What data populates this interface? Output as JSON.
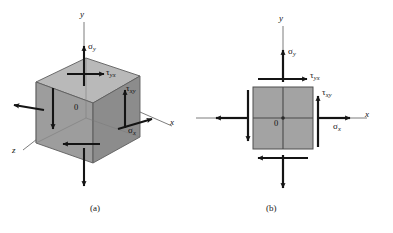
{
  "figure": {
    "background": "#ffffff",
    "width": 393,
    "height": 233,
    "colors": {
      "face_front": "#9a9a9a",
      "face_top": "#b4b4b4",
      "face_side": "#8a8a8a",
      "square_fill": "#a0a0a0",
      "stroke": "#1a1a1a",
      "axis_thin": "#6e6e6e"
    }
  },
  "panels": [
    {
      "id": "a",
      "caption": "(a)",
      "type": "3d-stress-element",
      "description": "Three-dimensional cubic stress element with normal and shear stresses",
      "axes": [
        {
          "name": "y-axis",
          "label": "y"
        },
        {
          "name": "x-axis",
          "label": "x"
        },
        {
          "name": "z-axis",
          "label": "z"
        }
      ],
      "origin_label": "0",
      "stress_labels": [
        {
          "name": "sigma-y",
          "symbol": "σ",
          "subscript": "y"
        },
        {
          "name": "sigma-x",
          "symbol": "σ",
          "subscript": "x"
        },
        {
          "name": "tau-yx",
          "symbol": "τ",
          "subscript": "yx"
        },
        {
          "name": "tau-xy",
          "symbol": "τ",
          "subscript": "xy"
        }
      ]
    },
    {
      "id": "b",
      "caption": "(b)",
      "type": "2d-stress-element",
      "description": "Two-dimensional plane stress element with normal and shear stresses",
      "axes": [
        {
          "name": "y-axis",
          "label": "y"
        },
        {
          "name": "x-axis",
          "label": "x"
        }
      ],
      "origin_label": "0",
      "stress_labels": [
        {
          "name": "sigma-y",
          "symbol": "σ",
          "subscript": "y"
        },
        {
          "name": "sigma-x",
          "symbol": "σ",
          "subscript": "x"
        },
        {
          "name": "tau-yx",
          "symbol": "τ",
          "subscript": "yx"
        },
        {
          "name": "tau-xy",
          "symbol": "τ",
          "subscript": "xy"
        }
      ]
    }
  ],
  "labels": {
    "a_axis_y": "y",
    "a_axis_x": "x",
    "a_axis_z": "z",
    "a_origin": "0",
    "a_sigma_y": "σ",
    "a_sigma_y_sub": "y",
    "a_sigma_x": "σ",
    "a_sigma_x_sub": "x",
    "a_tau_yx": "τ",
    "a_tau_yx_sub": "yx",
    "a_tau_xy": "τ",
    "a_tau_xy_sub": "xy",
    "b_axis_y": "y",
    "b_axis_x": "x",
    "b_origin": "0",
    "b_sigma_y": "σ",
    "b_sigma_y_sub": "y",
    "b_sigma_x": "σ",
    "b_sigma_x_sub": "x",
    "b_tau_yx": "τ",
    "b_tau_yx_sub": "yx",
    "b_tau_xy": "τ",
    "b_tau_xy_sub": "xy",
    "caption_a": "(a)",
    "caption_b": "(b)"
  }
}
